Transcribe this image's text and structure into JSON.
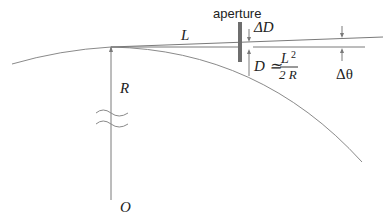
{
  "labels": {
    "aperture": "aperture",
    "L": "L",
    "R": "R",
    "O": "O",
    "delta_D": "ΔD",
    "delta_theta": "Δθ",
    "D_eq": "D ≃",
    "frac_num": "L",
    "frac_num_exp": "2",
    "frac_den": "2 R"
  },
  "colors": {
    "line": "#7a7a7a",
    "aperture": "#6e6e6e",
    "text": "#222222"
  }
}
